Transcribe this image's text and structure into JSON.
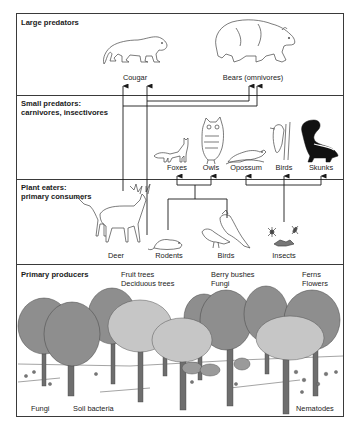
{
  "diagram": {
    "type": "food-web",
    "sections": [
      {
        "id": "large-predators",
        "label": "Large predators",
        "organisms": [
          "Cougar",
          "Bears (omnivores)"
        ]
      },
      {
        "id": "small-predators",
        "label_line1": "Small predators:",
        "label_line2": "carnivores, insectivores",
        "organisms": [
          "Foxes",
          "Owls",
          "Opossum",
          "Birds",
          "Skunks"
        ]
      },
      {
        "id": "plant-eaters",
        "label_line1": "Plant eaters:",
        "label_line2": "primary consumers",
        "organisms": [
          "Deer",
          "Rodents",
          "Birds",
          "Insects"
        ]
      },
      {
        "id": "primary-producers",
        "label": "Primary producers",
        "groups": [
          {
            "line1": "Fruit trees",
            "line2": "Deciduous trees"
          },
          {
            "line1": "Berry bushes",
            "line2": "Fungi"
          },
          {
            "line1": "Ferns",
            "line2": "Flowers"
          }
        ],
        "soil": [
          "Fungi",
          "Soil bacteria",
          "Nematodes"
        ]
      }
    ],
    "edges": [
      {
        "from": "Deer",
        "to": "Cougar"
      },
      {
        "from": "Deer",
        "to": "Bears (omnivores)"
      },
      {
        "from": "Rodents",
        "to": "Cougar"
      },
      {
        "from": "Rodents",
        "to": "Bears (omnivores)"
      },
      {
        "from": "Rodents",
        "to": "Foxes"
      },
      {
        "from": "Rodents",
        "to": "Owls"
      },
      {
        "from": "Birds",
        "to": "Foxes"
      },
      {
        "from": "Birds",
        "to": "Owls"
      },
      {
        "from": "Insects",
        "to": "Opossum"
      },
      {
        "from": "Insects",
        "to": "Birds"
      },
      {
        "from": "Insects",
        "to": "Skunks"
      }
    ],
    "colors": {
      "line": "#1a1a1a",
      "border": "#3a3a3a",
      "canopy_dark": "#8e8e8e",
      "canopy_light": "#c6c6c6",
      "trunk": "#6e6e6e",
      "outline": "#444444"
    }
  }
}
